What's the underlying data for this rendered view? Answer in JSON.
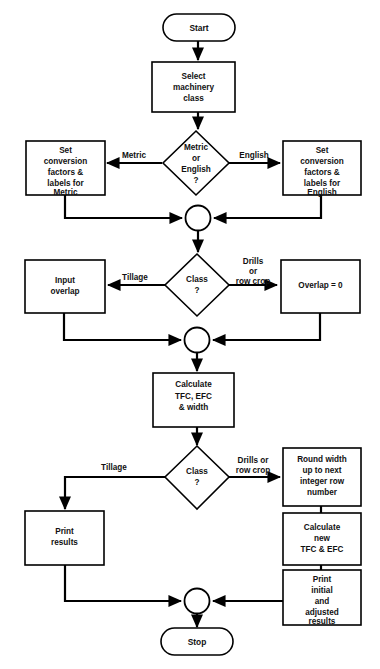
{
  "diagram": {
    "type": "flowchart",
    "background_color": "#ffffff",
    "line_color": "#000000",
    "text_color": "#111111"
  },
  "nodes": {
    "start": {
      "shape": "terminal",
      "label": "Start"
    },
    "select_machinery": {
      "shape": "process",
      "lines": [
        "Select",
        "machinery",
        "class"
      ]
    },
    "metric_or_english": {
      "shape": "decision",
      "lines": [
        "Metric",
        "or",
        "English",
        "?"
      ]
    },
    "set_metric": {
      "shape": "process",
      "lines": [
        "Set",
        "conversion",
        "factors &",
        "labels for",
        "Metric"
      ]
    },
    "set_english": {
      "shape": "process",
      "lines": [
        "Set",
        "conversion",
        "factors &",
        "labels for",
        "English"
      ]
    },
    "merge_1": {
      "shape": "connector",
      "label": ""
    },
    "class_1": {
      "shape": "decision",
      "lines": [
        "Class",
        "?"
      ]
    },
    "input_overlap": {
      "shape": "process",
      "lines": [
        "Input",
        "overlap"
      ]
    },
    "overlap_zero": {
      "shape": "process",
      "lines": [
        "Overlap = 0"
      ]
    },
    "merge_2": {
      "shape": "connector",
      "label": ""
    },
    "calculate_tfc": {
      "shape": "process",
      "lines": [
        "Calculate",
        "TFC, EFC",
        "& width"
      ]
    },
    "class_2": {
      "shape": "decision",
      "lines": [
        "Class",
        "?"
      ]
    },
    "print_results": {
      "shape": "process",
      "lines": [
        "Print",
        "results"
      ]
    },
    "round_width": {
      "shape": "process",
      "lines": [
        "Round width",
        "up to next",
        "integer row",
        "number"
      ]
    },
    "calculate_new": {
      "shape": "process",
      "lines": [
        "Calculate",
        "new",
        "TFC & EFC"
      ]
    },
    "print_initial": {
      "shape": "process",
      "lines": [
        "Print",
        "initial",
        "and",
        "adjusted",
        "results"
      ]
    },
    "merge_3": {
      "shape": "connector",
      "label": ""
    },
    "stop": {
      "shape": "terminal",
      "label": "Stop"
    }
  },
  "edge_labels": {
    "metric": "Metric",
    "english": "English",
    "tillage_1": "Tillage",
    "drills_1_line1": "Drills",
    "drills_1_line2": "or",
    "drills_1_line3": "row crop",
    "tillage_2": "Tillage",
    "drills_2_line1": "Drills or",
    "drills_2_line2": "row crop"
  }
}
